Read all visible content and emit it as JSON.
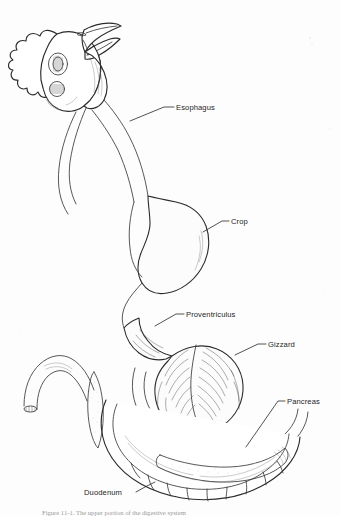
{
  "figure": {
    "background_color": "#fdfdfd",
    "ink_color": "#2b2b2b",
    "label_color": "#1d1d1d",
    "style": "pen-and-ink line drawing"
  },
  "labels": [
    {
      "id": "esophagus",
      "text": "Esophagus",
      "x": 176,
      "y": 110,
      "anchor": "start",
      "leader": "M 174 107 L 164 107 L 130 121"
    },
    {
      "id": "crop",
      "text": "Crop",
      "x": 231,
      "y": 224,
      "anchor": "start",
      "leader": "M 229 221 L 222 221 L 203 232"
    },
    {
      "id": "proventriculus",
      "text": "Proventriculus",
      "x": 186,
      "y": 317,
      "anchor": "start",
      "leader": "M 184 314 L 176 314 L 155 326"
    },
    {
      "id": "gizzard",
      "text": "Gizzard",
      "x": 268,
      "y": 347,
      "anchor": "start",
      "leader": "M 266 344 L 258 344 L 235 355"
    },
    {
      "id": "pancreas",
      "text": "Pancreas",
      "x": 287,
      "y": 404,
      "anchor": "start",
      "leader": "M 285 401 L 278 401 L 246 447"
    },
    {
      "id": "duodenum",
      "text": "Duodenum",
      "x": 84,
      "y": 495,
      "anchor": "start",
      "leader": "M 136 492 L 145 487 L 152 483"
    }
  ],
  "caption": {
    "text": "Figure 11-1.  The upper portion of the digestive system",
    "visible": "partially-cropped"
  },
  "organs": [
    {
      "id": "head",
      "name": "Head with comb, beak and eye"
    },
    {
      "id": "esophagus",
      "name": "Esophagus tube"
    },
    {
      "id": "crop",
      "name": "Crop sac"
    },
    {
      "id": "proventriculus",
      "name": "Proventriculus"
    },
    {
      "id": "gizzard",
      "name": "Gizzard"
    },
    {
      "id": "duodenum",
      "name": "Duodenal loop"
    },
    {
      "id": "pancreas",
      "name": "Pancreas"
    },
    {
      "id": "intestine",
      "name": "Cut small intestine end"
    }
  ]
}
